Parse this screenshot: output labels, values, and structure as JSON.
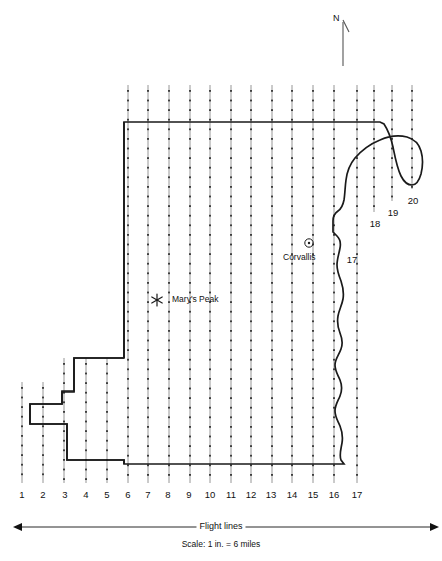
{
  "figure": {
    "background_color": "#ffffff",
    "line_color": "#111111",
    "flightline_color": "#8a8a8a",
    "tick_color": "#333333"
  },
  "compass": {
    "label": "N",
    "name": "north-arrow"
  },
  "places": [
    {
      "name": "corvallis",
      "label": "Corvallis",
      "symbol": "circled-dot",
      "x": 309,
      "y": 243,
      "label_x": 283,
      "label_y": 254
    },
    {
      "name": "marys-peak",
      "label": "Mary's Peak",
      "symbol": "asterisk-star",
      "x": 157,
      "y": 300,
      "label_x": 172,
      "label_y": 296
    }
  ],
  "flight_lines": {
    "label_group": "Flight lines",
    "numbers": [
      "1",
      "2",
      "3",
      "4",
      "5",
      "6",
      "7",
      "8",
      "9",
      "10",
      "11",
      "12",
      "13",
      "14",
      "15",
      "16",
      "17",
      "18",
      "19",
      "20"
    ],
    "bottom_labels": [
      {
        "n": "1",
        "x": 22,
        "y": 490
      },
      {
        "n": "2",
        "x": 43,
        "y": 490
      },
      {
        "n": "3",
        "x": 65,
        "y": 490
      },
      {
        "n": "4",
        "x": 86,
        "y": 490
      },
      {
        "n": "5",
        "x": 107,
        "y": 490
      },
      {
        "n": "6",
        "x": 128,
        "y": 490
      },
      {
        "n": "7",
        "x": 148,
        "y": 490
      },
      {
        "n": "8",
        "x": 168,
        "y": 490
      },
      {
        "n": "9",
        "x": 189,
        "y": 490
      },
      {
        "n": "10",
        "x": 210,
        "y": 490
      },
      {
        "n": "11",
        "x": 231,
        "y": 490
      },
      {
        "n": "12",
        "x": 251,
        "y": 490
      },
      {
        "n": "13",
        "x": 271,
        "y": 490
      },
      {
        "n": "14",
        "x": 292,
        "y": 490
      },
      {
        "n": "15",
        "x": 313,
        "y": 490
      },
      {
        "n": "16",
        "x": 334,
        "y": 490
      },
      {
        "n": "17",
        "x": 357,
        "y": 490
      }
    ],
    "side_labels": [
      {
        "n": "17",
        "x": 352,
        "y": 255
      },
      {
        "n": "18",
        "x": 375,
        "y": 219
      },
      {
        "n": "19",
        "x": 393,
        "y": 208
      },
      {
        "n": "20",
        "x": 413,
        "y": 196
      }
    ]
  },
  "scale": {
    "caption": "Flight lines",
    "text": "Scale:  1 in. = 6 miles",
    "arrow_left_x": 22,
    "arrow_right_x": 430,
    "arrow_y": 527
  }
}
